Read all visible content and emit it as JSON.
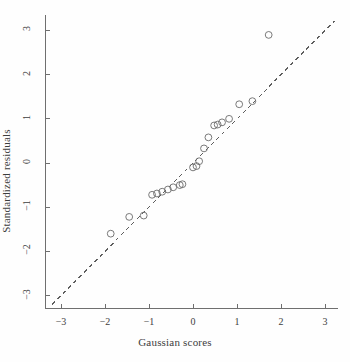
{
  "chart_data": {
    "type": "scatter",
    "title": "",
    "xlabel": "Gaussian scores",
    "ylabel": "Standardized residuals",
    "xlim": [
      -3.35,
      3.3
    ],
    "ylim": [
      -3.3,
      3.35
    ],
    "xticks": [
      -3,
      -2,
      -1,
      0,
      1,
      2,
      3
    ],
    "yticks": [
      -3,
      -2,
      -1,
      0,
      1,
      2,
      3
    ],
    "xticklabels": [
      "−3",
      "−2",
      "−1",
      "0",
      "1",
      "2",
      "3"
    ],
    "yticklabels": [
      "−3",
      "−2",
      "−1",
      "0",
      "1",
      "2",
      "3"
    ],
    "grid": false,
    "legend": false,
    "marker": "open-circle",
    "marker_color": "#6b6b6b",
    "axis_color": "#6f6f6f",
    "reference_line": {
      "style": "dashed",
      "color": "#5e5e5e",
      "slope": 1,
      "intercept": 0,
      "x_start": -3.2,
      "x_end": 3.22
    },
    "points": [
      {
        "x": -1.87,
        "y": -1.6
      },
      {
        "x": -1.45,
        "y": -1.22
      },
      {
        "x": -1.12,
        "y": -1.19
      },
      {
        "x": -0.93,
        "y": -0.72
      },
      {
        "x": -0.82,
        "y": -0.69
      },
      {
        "x": -0.7,
        "y": -0.65
      },
      {
        "x": -0.57,
        "y": -0.6
      },
      {
        "x": -0.45,
        "y": -0.55
      },
      {
        "x": -0.3,
        "y": -0.5
      },
      {
        "x": -0.24,
        "y": -0.48
      },
      {
        "x": 0.0,
        "y": -0.1
      },
      {
        "x": 0.08,
        "y": -0.07
      },
      {
        "x": 0.14,
        "y": 0.04
      },
      {
        "x": 0.25,
        "y": 0.33
      },
      {
        "x": 0.35,
        "y": 0.58
      },
      {
        "x": 0.48,
        "y": 0.85
      },
      {
        "x": 0.56,
        "y": 0.87
      },
      {
        "x": 0.66,
        "y": 0.92
      },
      {
        "x": 0.82,
        "y": 1.0
      },
      {
        "x": 1.05,
        "y": 1.33
      },
      {
        "x": 1.35,
        "y": 1.4
      },
      {
        "x": 1.72,
        "y": 2.9
      }
    ]
  }
}
